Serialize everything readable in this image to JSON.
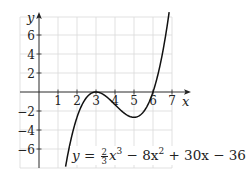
{
  "chart_data": {
    "type": "line",
    "title": "",
    "equation_label": {
      "prefix": "y = ",
      "frac_num": "2",
      "frac_den": "3",
      "rest_1": "x",
      "exp_1": "3",
      "rest_2": " − 8x",
      "exp_2": "2",
      "rest_3": " + 30x − 36"
    },
    "function": "y = (2/3)x^3 - 8x^2 + 30x - 36",
    "xlabel": "x",
    "ylabel": "y",
    "xlim": [
      0,
      7
    ],
    "ylim": [
      -8,
      7.8
    ],
    "x_ticks": [
      "1",
      "2",
      "3",
      "4",
      "5",
      "6",
      "7"
    ],
    "y_ticks": [
      "-6",
      "-4",
      "-2",
      "2",
      "4",
      "6"
    ],
    "grid": true,
    "grid_x_step": 1,
    "grid_y_step": 2,
    "series": [
      {
        "name": "cubic",
        "color": "#111111",
        "x": [
          1.4,
          2.0,
          2.5,
          3.0,
          3.5,
          4.0,
          4.5,
          5.0,
          5.5,
          6.0,
          6.5,
          6.85
        ],
        "y": [
          -8.0,
          -2.67,
          -0.58,
          0.0,
          -0.42,
          -1.33,
          -2.25,
          -2.67,
          -2.08,
          0.0,
          3.92,
          7.8
        ]
      }
    ],
    "key_points": {
      "local_max": [
        3,
        0
      ],
      "local_min": [
        5,
        -2.667
      ],
      "roots": [
        3,
        6
      ]
    }
  },
  "colors": {
    "grid": "#d9d9d9",
    "axis": "#222222",
    "curve": "#111111",
    "background": "#ffffff"
  }
}
